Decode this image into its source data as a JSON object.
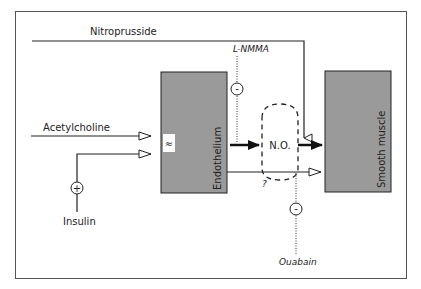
{
  "diagram": {
    "labels": {
      "nitroprusside": "Nitroprusside",
      "lnmma": "L-NMMA",
      "acetylcholine": "Acetylcholine",
      "insulin": "Insulin",
      "endothelium": "Endothelium",
      "smooth_muscle": "Smooth muscle",
      "no": "N.O.",
      "unknown": "?",
      "ouabain": "Ouabain",
      "plus": "+",
      "minus": "-",
      "receptor": "≈"
    },
    "colors": {
      "box_fill": "#9a9a9a",
      "line": "#222222",
      "frame": "#555555"
    }
  }
}
